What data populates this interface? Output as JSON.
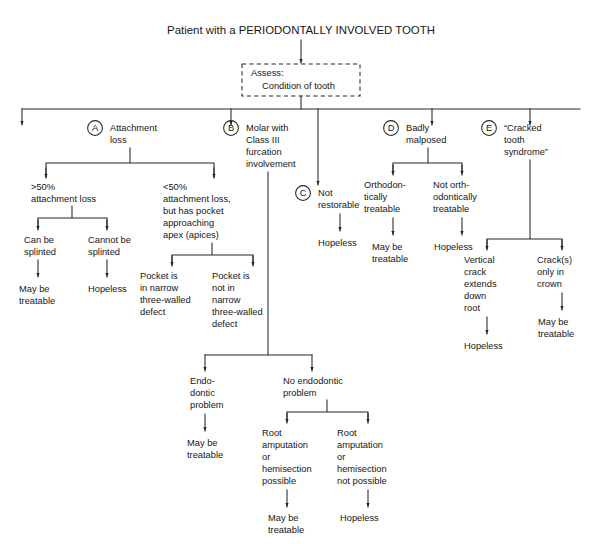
{
  "diagram": {
    "title": "Patient with a PERIODONTALLY INVOLVED TOOTH",
    "type": "flowchart",
    "orientation": "top-down",
    "background_color": "#ffffff",
    "line_color": "#262626",
    "text_color": "#161616",
    "root": {
      "label_line1": "Assess:",
      "label_line2": "Condition of tooth",
      "shape": "dashed-rectangle"
    },
    "branches": [
      {
        "key": "A",
        "badge": "A",
        "lines": [
          "Attachment",
          "loss"
        ]
      },
      {
        "key": "B",
        "badge": "B",
        "lines": [
          "Molar with",
          "Class III",
          "furcation",
          "involvement"
        ]
      },
      {
        "key": "C",
        "badge": "C",
        "lines": [
          "Not",
          "restorable"
        ]
      },
      {
        "key": "D",
        "badge": "D",
        "lines": [
          "Badly",
          "malposed"
        ]
      },
      {
        "key": "E",
        "badge": "E",
        "lines": [
          "“Cracked",
          "tooth",
          "syndrome”"
        ]
      }
    ],
    "nodes": {
      "a_more50": {
        "lines": [
          ">50%",
          "attachment loss"
        ]
      },
      "a_less50": {
        "lines": [
          "<50%",
          "attachment loss,",
          "but has pocket",
          "approaching",
          "apex (apices)"
        ]
      },
      "can_splint": {
        "lines": [
          "Can be",
          "splinted"
        ]
      },
      "cannot_splint": {
        "lines": [
          "Cannot be",
          "splinted"
        ]
      },
      "splint_outcome": {
        "lines": [
          "May be",
          "treatable"
        ]
      },
      "nosplint_outcome": {
        "lines": [
          "Hopeless"
        ]
      },
      "pocket_narrow": {
        "lines": [
          "Pocket is",
          "in narrow",
          "three-walled",
          "defect"
        ]
      },
      "pocket_not_narrow": {
        "lines": [
          "Pocket is",
          "not in",
          "narrow",
          "three-walled",
          "defect"
        ]
      },
      "endo_problem": {
        "lines": [
          "Endo-",
          "dontic",
          "problem"
        ]
      },
      "endo_outcome": {
        "lines": [
          "May be",
          "treatable"
        ]
      },
      "no_endo_problem": {
        "lines": [
          "No endodontic",
          "problem"
        ]
      },
      "root_amp_possible": {
        "lines": [
          "Root",
          "amputation",
          "or",
          "hemisection",
          "possible"
        ]
      },
      "root_amp_not_possible": {
        "lines": [
          "Root",
          "amputation",
          "or",
          "hemisection",
          "not possible"
        ]
      },
      "root_amp_outcome": {
        "lines": [
          "May be",
          "treatable"
        ]
      },
      "root_amp_not_outcome": {
        "lines": [
          "Hopeless"
        ]
      },
      "c_outcome": {
        "lines": [
          "Hopeless"
        ]
      },
      "ortho_treatable": {
        "lines": [
          "Orthodon-",
          "tically",
          "treatable"
        ]
      },
      "not_ortho_treatable": {
        "lines": [
          "Not orth-",
          "odontically",
          "treatable"
        ]
      },
      "ortho_outcome": {
        "lines": [
          "May be",
          "treatable"
        ]
      },
      "not_ortho_outcome": {
        "lines": [
          "Hopeless"
        ]
      },
      "vertical_crack": {
        "lines": [
          "Vertical",
          "crack",
          "extends",
          "down",
          "root"
        ]
      },
      "crack_crown": {
        "lines": [
          "Crack(s)",
          "only in",
          "crown"
        ]
      },
      "vertical_crack_outcome": {
        "lines": [
          "Hopeless"
        ]
      },
      "crack_crown_outcome": {
        "lines": [
          "May be",
          "treatable"
        ]
      }
    }
  }
}
